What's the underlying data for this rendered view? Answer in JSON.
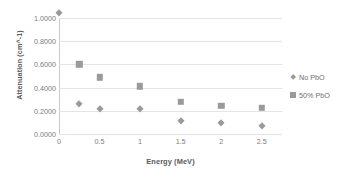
{
  "chart_data": {
    "type": "scatter",
    "title": "",
    "xlabel": "Energy (MeV)",
    "ylabel": "Attenuation (cm^-1)",
    "xlim": [
      0,
      2.75
    ],
    "ylim": [
      0,
      1.0
    ],
    "grid": true,
    "legend_position": "right",
    "x_ticks": [
      "0",
      "0.5",
      "1",
      "1.5",
      "2",
      "2.5"
    ],
    "x_tick_values": [
      0,
      0.5,
      1,
      1.5,
      2,
      2.5
    ],
    "y_ticks": [
      "0.0000",
      "0.2000",
      "0.4000",
      "0.6000",
      "0.8000",
      "1.0000"
    ],
    "y_tick_values": [
      0,
      0.2,
      0.4,
      0.6,
      0.8,
      1.0
    ],
    "series": [
      {
        "name": "No PbO",
        "marker": "diamond",
        "color": "#9a9a9a",
        "x": [
          0,
          0.25,
          0.5,
          1,
          1.5,
          2,
          2.5
        ],
        "values": [
          1.045,
          0.26,
          0.215,
          0.212,
          0.11,
          0.095,
          0.07
        ]
      },
      {
        "name": "50% PbO",
        "marker": "square",
        "color": "#9a9a9a",
        "x": [
          0.25,
          0.5,
          1,
          1.5,
          2,
          2.5
        ],
        "values": [
          0.6,
          0.49,
          0.41,
          0.28,
          0.245,
          0.225
        ]
      }
    ]
  },
  "legend": {
    "entries": [
      {
        "label": "No PbO",
        "marker": "diamond-marker-icon"
      },
      {
        "label": "50% PbO",
        "marker": "square-marker-icon"
      }
    ]
  },
  "colors": {
    "marker": "#9a9a9a",
    "gridline": "#e4e4e4",
    "axis": "#c9c9c9",
    "tick_text": "#7d7d7d",
    "title_text": "#5a5a5a",
    "background": "#ffffff"
  }
}
